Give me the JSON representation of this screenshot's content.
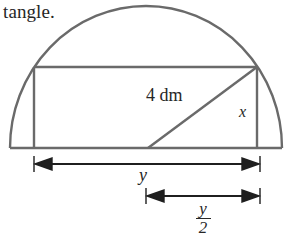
{
  "document": {
    "caption_fragment": "tangle."
  },
  "figure": {
    "name": "rectangle-inscribed-in-semicircle",
    "stroke_color": "#6a6a6a",
    "text_color": "#262626",
    "background_color": "#ffffff",
    "labels": {
      "hypotenuse": "4 dm",
      "height": "x",
      "width": "y",
      "half_width_numerator": "y",
      "half_width_denominator": "2"
    },
    "geometry": {
      "baseline_left_x": 10,
      "baseline_right_x": 282,
      "baseline_y": 148,
      "arc_apex_x": 146,
      "arc_apex_y": 6,
      "rect_left_x": 34,
      "rect_right_x": 257,
      "rect_top_y": 67,
      "rect_bottom_y": 148,
      "diagonal_start_x": 148,
      "diagonal_start_y": 148,
      "diagonal_end_x": 257,
      "diagonal_end_y": 67,
      "dim_y_line_y": 164,
      "dim_y_left_x": 34,
      "dim_y_right_x": 257,
      "dim_half_line_y": 196,
      "dim_half_left_x": 146,
      "dim_half_right_x": 257
    }
  }
}
